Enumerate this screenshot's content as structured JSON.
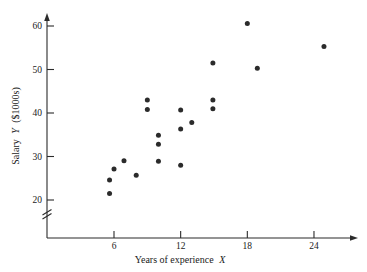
{
  "chart_data": {
    "type": "scatter",
    "title": "",
    "xlabel": "Years of experience X",
    "ylabel": "Salary Y ($1000s)",
    "xlabel_main": "Years of experience",
    "xlabel_var": "X",
    "ylabel_main": "Salary",
    "ylabel_var": "Y",
    "ylabel_units": "($1000s)",
    "xlim": [
      3.2,
      26.5
    ],
    "ylim": [
      19.0,
      62.0
    ],
    "xticks": [
      6,
      12,
      18,
      24
    ],
    "xtick_labels": [
      "6",
      "12",
      "18",
      "24"
    ],
    "yticks": [
      20,
      30,
      40,
      50,
      60
    ],
    "ytick_labels": [
      "20",
      "30",
      "40",
      "50",
      "60"
    ],
    "grid": false,
    "legend": null,
    "axis_break_y": true,
    "marker": "filled-circle",
    "marker_color": "#2b2b2b",
    "points": [
      {
        "x": 5.6,
        "y": 24.6
      },
      {
        "x": 5.6,
        "y": 21.5
      },
      {
        "x": 6.0,
        "y": 27.1
      },
      {
        "x": 6.9,
        "y": 29.0
      },
      {
        "x": 8.0,
        "y": 25.7
      },
      {
        "x": 9.0,
        "y": 43.0
      },
      {
        "x": 9.0,
        "y": 40.8
      },
      {
        "x": 10.0,
        "y": 34.9
      },
      {
        "x": 10.0,
        "y": 32.8
      },
      {
        "x": 10.0,
        "y": 28.9
      },
      {
        "x": 12.0,
        "y": 40.7
      },
      {
        "x": 12.0,
        "y": 36.3
      },
      {
        "x": 12.0,
        "y": 28.0
      },
      {
        "x": 13.0,
        "y": 37.8
      },
      {
        "x": 14.9,
        "y": 51.5
      },
      {
        "x": 14.9,
        "y": 43.0
      },
      {
        "x": 14.9,
        "y": 41.0
      },
      {
        "x": 18.0,
        "y": 60.6
      },
      {
        "x": 18.9,
        "y": 50.3
      },
      {
        "x": 24.9,
        "y": 55.3
      }
    ]
  },
  "axis": {
    "x_arrow": true,
    "y_arrow": true
  }
}
